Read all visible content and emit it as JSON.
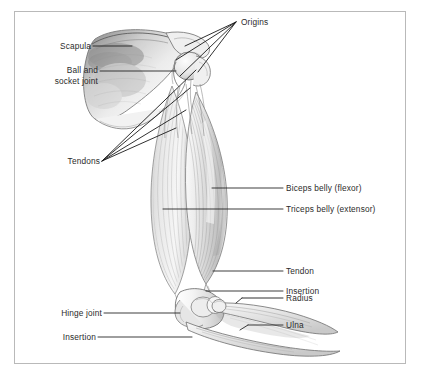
{
  "figure": {
    "background_color": "#ffffff",
    "frame_color": "#b9b9b9",
    "label_color": "#2b2b2b",
    "leader_color": "#1a1a1a",
    "art_style": "graphite pencil and wash anatomical illustration"
  },
  "labels": {
    "scapula": "Scapula",
    "ball_and_socket_joint_line1": "Ball and",
    "ball_and_socket_joint_line2": "socket joint",
    "tendons": "Tendons",
    "origins": "Origins",
    "biceps_belly": "Biceps belly (flexor)",
    "triceps_belly": "Triceps belly (extensor)",
    "tendon": "Tendon",
    "insertion_right": "Insertion",
    "radius": "Radius",
    "ulna": "Ulna",
    "hinge_joint": "Hinge joint",
    "insertion_left": "Insertion"
  },
  "anatomy": {
    "bones": [
      "Scapula",
      "Humerus",
      "Radius",
      "Ulna"
    ],
    "muscles": [
      "Biceps belly (flexor)",
      "Triceps belly (extensor)"
    ],
    "joints": [
      "Ball and socket joint",
      "Hinge joint"
    ],
    "attachments": [
      "Origins",
      "Tendons",
      "Tendon",
      "Insertion"
    ]
  }
}
